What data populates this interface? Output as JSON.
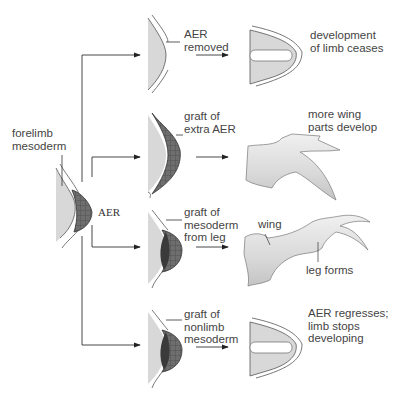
{
  "figure": {
    "type": "limb development experiment diagram",
    "source_tissue": {
      "label": "forelimb\nmesoderm",
      "aer_label": "AER"
    },
    "experiments": [
      {
        "id": "aer-removed",
        "manipulation": "AER\nremoved",
        "result": "development\nof limb ceases"
      },
      {
        "id": "extra-aer",
        "manipulation": "graft of\nextra AER",
        "result": "more wing\nparts develop"
      },
      {
        "id": "leg-mesoderm",
        "manipulation": "graft of\nmesoderm\nfrom leg",
        "result_labels": {
          "wing": "wing",
          "leg": "leg forms"
        }
      },
      {
        "id": "nonlimb-mesoderm",
        "manipulation": "graft of\nnonlimb\nmesoderm",
        "result": "AER regresses;\nlimb stops\ndeveloping"
      }
    ],
    "colors": {
      "mesoderm": "#d8d8d8",
      "aer": "#6e6e6e",
      "graft_dark": "#3a3a3a",
      "line": "#333333",
      "text": "#444444"
    }
  }
}
